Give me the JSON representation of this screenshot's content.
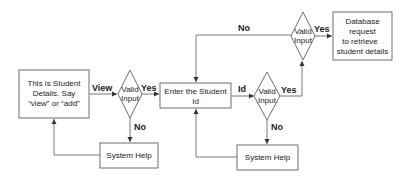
{
  "diagram": {
    "nodes": {
      "intro": {
        "lines": [
          "This is Student",
          "Details. Say",
          "“view” or “add”"
        ]
      },
      "valid1": {
        "lines": [
          "Valid",
          "Input"
        ]
      },
      "help1": {
        "label": "System Help"
      },
      "enter_id": {
        "lines": [
          "Enter the Student",
          "Id"
        ]
      },
      "valid2": {
        "lines": [
          "Valid",
          "Input"
        ]
      },
      "help2": {
        "label": "System Help"
      },
      "valid3": {
        "lines": [
          "Valid",
          "Input"
        ]
      },
      "db": {
        "lines": [
          "Database",
          "request",
          "to retrieve",
          "student details"
        ]
      }
    },
    "edges": {
      "view": "View",
      "yes1": "Yes",
      "no1": "No",
      "id": "Id",
      "yes2": "Yes",
      "no2": "No",
      "yes3": "Yes",
      "no3": "No"
    },
    "colors": {
      "stroke": "#6e6e6e",
      "text": "#222222",
      "background": "#ffffff"
    }
  }
}
